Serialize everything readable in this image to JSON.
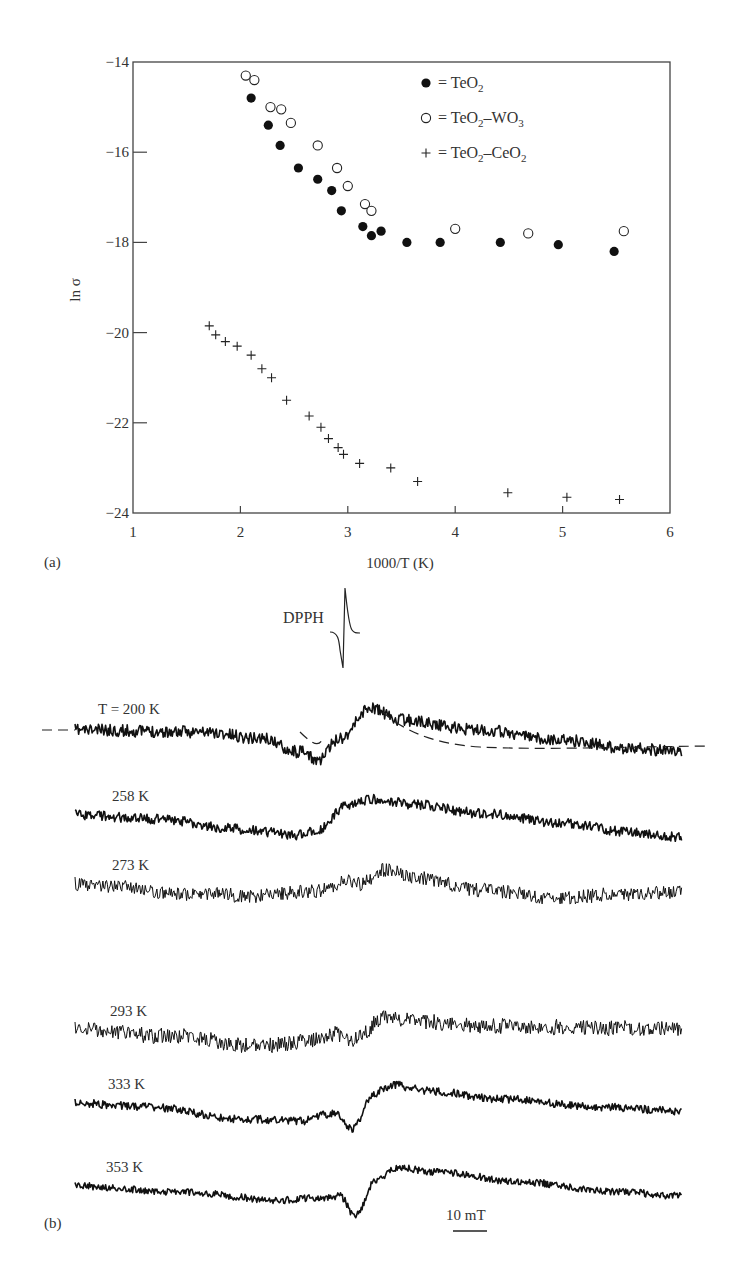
{
  "chart_data": [
    {
      "panel": "(a)",
      "type": "scatter",
      "xlabel": "1000/T (K)",
      "ylabel": "ln σ",
      "xlim": [
        1,
        6
      ],
      "ylim": [
        -24,
        -14
      ],
      "xticks": [
        "1",
        "2",
        "3",
        "4",
        "5",
        "6"
      ],
      "yticks": [
        "-14",
        "-16",
        "-18",
        "-20",
        "-22",
        "-24"
      ],
      "grid": false,
      "legend_position": "upper right",
      "series": [
        {
          "name": "TeO2",
          "legend": "= TeO₂",
          "marker": "filled-circle",
          "x": [
            2.1,
            2.26,
            2.37,
            2.54,
            2.72,
            2.85,
            2.94,
            3.14,
            3.22,
            3.31,
            3.55,
            3.86,
            4.42,
            4.96,
            5.48
          ],
          "y": [
            -14.8,
            -15.4,
            -15.85,
            -16.35,
            -16.6,
            -16.85,
            -17.3,
            -17.65,
            -17.85,
            -17.75,
            -18.0,
            -18.0,
            -18.0,
            -18.05,
            -18.2
          ]
        },
        {
          "name": "TeO2-WO3",
          "legend": "= TeO₂–WO₃",
          "marker": "open-circle",
          "x": [
            2.05,
            2.13,
            2.28,
            2.38,
            2.47,
            2.72,
            2.9,
            3.0,
            3.16,
            3.22,
            4.0,
            4.68,
            5.57
          ],
          "y": [
            -14.3,
            -14.4,
            -15.0,
            -15.05,
            -15.35,
            -15.85,
            -16.35,
            -16.75,
            -17.15,
            -17.3,
            -17.7,
            -17.8,
            -17.75
          ]
        },
        {
          "name": "TeO2-CeO2",
          "legend": "+ = TeO₂–CeO₂",
          "marker": "plus",
          "x": [
            1.71,
            1.77,
            1.86,
            1.97,
            2.1,
            2.2,
            2.29,
            2.43,
            2.64,
            2.75,
            2.82,
            2.91,
            2.96,
            3.11,
            3.4,
            3.65,
            4.49,
            5.04,
            5.53
          ],
          "y": [
            -19.85,
            -20.05,
            -20.2,
            -20.3,
            -20.5,
            -20.8,
            -21.0,
            -21.5,
            -21.85,
            -22.1,
            -22.35,
            -22.55,
            -22.7,
            -22.9,
            -23.0,
            -23.3,
            -23.55,
            -23.65,
            -23.7
          ]
        }
      ]
    },
    {
      "panel": "(b)",
      "type": "line",
      "title": "",
      "xlabel": "Magnetic field",
      "scale_bar": "10 mT",
      "reference_marker": "DPPH",
      "series": [
        {
          "name": "T = 200 K",
          "label": "T = 200 K",
          "noise": 6,
          "fit_curve": true
        },
        {
          "name": "258 K",
          "label": "258 K",
          "noise": 5
        },
        {
          "name": "273 K",
          "label": "273 K",
          "noise": 7
        },
        {
          "name": "293 K",
          "label": "293 K",
          "noise": 8
        },
        {
          "name": "333 K",
          "label": "333 K",
          "noise": 4
        },
        {
          "name": "353 K",
          "label": "353 K",
          "noise": 3.5
        }
      ]
    }
  ],
  "panel_a": {
    "panel_label": "(a)",
    "xlabel": "1000/T (K)",
    "ylabel": "ln σ",
    "legend": [
      {
        "symbol": "filled-circle",
        "text": "= TeO",
        "sub": "2",
        "rest": ""
      },
      {
        "symbol": "open-circle",
        "text": "= TeO",
        "sub": "2",
        "rest": "–WO",
        "sub2": "3"
      },
      {
        "symbol": "plus",
        "text": "= TeO",
        "sub": "2",
        "rest": "–CeO",
        "sub2": "2"
      }
    ]
  },
  "panel_b": {
    "panel_label": "(b)",
    "dpph_label": "DPPH",
    "scale_bar_label": "10 mT",
    "traces": [
      {
        "label": "T = 200 K",
        "label_x": 98,
        "label_y": 714,
        "y0": 730,
        "dip": 10,
        "rise": -42,
        "tail": 22,
        "noise": 6,
        "seed": 11,
        "shape": [
          [
            75,
            0
          ],
          [
            200,
            2
          ],
          [
            260,
            8
          ],
          [
            300,
            22
          ],
          [
            318,
            30
          ],
          [
            340,
            8
          ],
          [
            370,
            -22
          ],
          [
            400,
            -10
          ],
          [
            480,
            0
          ],
          [
            560,
            10
          ],
          [
            630,
            18
          ],
          [
            682,
            22
          ]
        ]
      },
      {
        "label": "258 K",
        "label_x": 112,
        "label_y": 801,
        "y0": 815,
        "noise": 5,
        "seed": 23,
        "shape": [
          [
            75,
            0
          ],
          [
            160,
            4
          ],
          [
            240,
            14
          ],
          [
            300,
            20
          ],
          [
            320,
            14
          ],
          [
            345,
            -8
          ],
          [
            370,
            -16
          ],
          [
            420,
            -10
          ],
          [
            480,
            -2
          ],
          [
            560,
            8
          ],
          [
            640,
            18
          ],
          [
            682,
            22
          ]
        ]
      },
      {
        "label": "273 K",
        "label_x": 112,
        "label_y": 870,
        "y0": 884,
        "noise": 7,
        "seed": 37,
        "shape": [
          [
            75,
            0
          ],
          [
            200,
            10
          ],
          [
            260,
            12
          ],
          [
            300,
            8
          ],
          [
            330,
            6
          ],
          [
            345,
            -4
          ],
          [
            360,
            0
          ],
          [
            385,
            -14
          ],
          [
            420,
            -6
          ],
          [
            480,
            6
          ],
          [
            560,
            14
          ],
          [
            620,
            10
          ],
          [
            682,
            8
          ]
        ]
      },
      {
        "label": "293 K",
        "label_x": 110,
        "label_y": 1016,
        "y0": 1030,
        "noise": 8,
        "seed": 51,
        "shape": [
          [
            75,
            0
          ],
          [
            170,
            6
          ],
          [
            260,
            16
          ],
          [
            300,
            12
          ],
          [
            335,
            4
          ],
          [
            350,
            10
          ],
          [
            360,
            4
          ],
          [
            385,
            -14
          ],
          [
            420,
            -8
          ],
          [
            500,
            -4
          ],
          [
            600,
            -2
          ],
          [
            682,
            -2
          ]
        ]
      },
      {
        "label": "333 K",
        "label_x": 108,
        "label_y": 1089,
        "y0": 1103,
        "noise": 4,
        "seed": 67,
        "shape": [
          [
            75,
            0
          ],
          [
            150,
            4
          ],
          [
            240,
            16
          ],
          [
            300,
            18
          ],
          [
            335,
            10
          ],
          [
            352,
            26
          ],
          [
            375,
            -10
          ],
          [
            392,
            -18
          ],
          [
            430,
            -12
          ],
          [
            500,
            -4
          ],
          [
            600,
            4
          ],
          [
            682,
            8
          ]
        ]
      },
      {
        "label": "353 K",
        "label_x": 106,
        "label_y": 1172,
        "y0": 1186,
        "noise": 3.5,
        "seed": 79,
        "shape": [
          [
            75,
            0
          ],
          [
            180,
            6
          ],
          [
            280,
            14
          ],
          [
            320,
            12
          ],
          [
            340,
            10
          ],
          [
            355,
            30
          ],
          [
            375,
            -4
          ],
          [
            395,
            -18
          ],
          [
            440,
            -14
          ],
          [
            520,
            -4
          ],
          [
            620,
            6
          ],
          [
            682,
            10
          ]
        ]
      }
    ]
  }
}
